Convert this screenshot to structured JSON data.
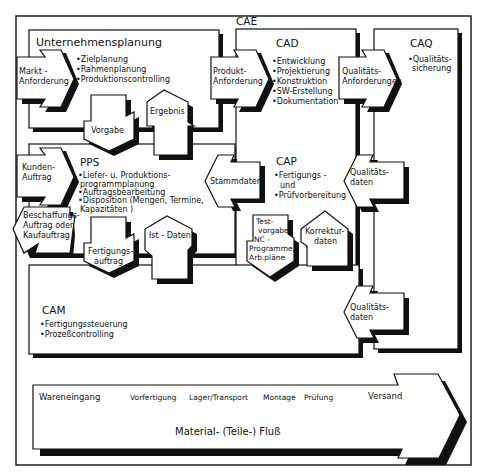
{
  "diagram": {
    "outer_label": "CAE",
    "modules": {
      "unternehmensplanung": {
        "title": "Unternehmensplanung",
        "items": [
          "•Zielplanung",
          "•Rahmenplanung",
          "•Produktionscontrolling"
        ]
      },
      "pps": {
        "title": "PPS",
        "items": [
          "•Liefer- u. Produktions-",
          "programmplanung",
          "•Auftragsbearbeitung",
          "•Disposition (Mengen, Termine,",
          "Kapazitäten )"
        ]
      },
      "cad": {
        "title": "CAD",
        "items": [
          "•Entwicklung",
          "•Projektierung",
          "•Konstruktion",
          "•SW-Erstellung",
          "•Dokumentation"
        ]
      },
      "cap": {
        "title": "CAP",
        "items": [
          "•Fertigungs -",
          "und",
          "•Prüfvorbereitung"
        ]
      },
      "caq": {
        "title": "CAQ",
        "items": [
          "•Qualitäts-",
          "sicherung"
        ]
      },
      "cam": {
        "title": "CAM",
        "items": [
          "•Fertigungssteuerung",
          "•Prozeßcontrolling"
        ]
      }
    },
    "arrows": {
      "markt_anforderung": [
        "Markt -",
        "Anforderung"
      ],
      "produkt_anforderung": [
        "Produkt-",
        "Anforderung"
      ],
      "qualitaets_anforderungen": [
        "Qualitäts-",
        "Anforderungen"
      ],
      "vorgabe": [
        "Vorgabe"
      ],
      "ergebnis": [
        "Ergebnis"
      ],
      "kunden_auftrag": [
        "Kunden-",
        "Auftrag"
      ],
      "stammdaten": [
        "Stammdaten"
      ],
      "qualitaetsdaten_cap": [
        "Qualitäts-",
        "daten"
      ],
      "beschaffungsauftrag": [
        "Beschaffungs-",
        "Auftrag oder",
        "Kaufauftrag"
      ],
      "fertigungsauftrag": [
        "Fertigungs-",
        "auftrag"
      ],
      "ist_daten": [
        "Ist - Daten"
      ],
      "testvorgabe": [
        "Test-",
        "vorgabe,",
        "NC -",
        "Programme,",
        "Arb.pläne"
      ],
      "korrekturdaten": [
        "Korrektur-",
        "daten"
      ],
      "qualitaetsdaten_cam": [
        "Qualitäts-",
        "daten"
      ]
    },
    "material_flow": {
      "stations": [
        "Wareneingang",
        "Vorfertigung",
        "Lager/Transport",
        "Montage",
        "Prüfung",
        "Versand"
      ],
      "label": "Material- (Teile-) Fluß"
    }
  }
}
